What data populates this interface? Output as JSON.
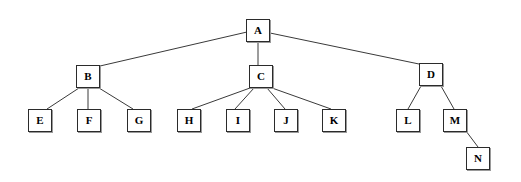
{
  "diagram": {
    "type": "tree-diagram",
    "canvas": {
      "width": 521,
      "height": 182,
      "background": "#ffffff"
    },
    "style": {
      "node_fill": "#ffffff",
      "node_border": "#2b2b2b",
      "node_shadow": "#9a9a9a",
      "edge_color": "#3a3a3a",
      "label_color": "#000000"
    },
    "nodes": [
      {
        "id": "A",
        "label": "A",
        "x": 246,
        "y": 19,
        "w": 24,
        "h": 23,
        "level": 0
      },
      {
        "id": "B",
        "label": "B",
        "x": 76,
        "y": 65,
        "w": 24,
        "h": 23,
        "level": 1
      },
      {
        "id": "C",
        "label": "C",
        "x": 249,
        "y": 65,
        "w": 24,
        "h": 23,
        "level": 1
      },
      {
        "id": "D",
        "label": "D",
        "x": 419,
        "y": 63,
        "w": 24,
        "h": 23,
        "level": 1
      },
      {
        "id": "E",
        "label": "E",
        "x": 28,
        "y": 109,
        "w": 24,
        "h": 23,
        "level": 2
      },
      {
        "id": "F",
        "label": "F",
        "x": 77,
        "y": 109,
        "w": 24,
        "h": 23,
        "level": 2
      },
      {
        "id": "G",
        "label": "G",
        "x": 127,
        "y": 109,
        "w": 24,
        "h": 23,
        "level": 2
      },
      {
        "id": "H",
        "label": "H",
        "x": 177,
        "y": 109,
        "w": 24,
        "h": 23,
        "level": 2
      },
      {
        "id": "I",
        "label": "I",
        "x": 226,
        "y": 109,
        "w": 24,
        "h": 23,
        "level": 2
      },
      {
        "id": "J",
        "label": "J",
        "x": 274,
        "y": 109,
        "w": 24,
        "h": 23,
        "level": 2
      },
      {
        "id": "K",
        "label": "K",
        "x": 322,
        "y": 109,
        "w": 24,
        "h": 23,
        "level": 2
      },
      {
        "id": "L",
        "label": "L",
        "x": 396,
        "y": 109,
        "w": 24,
        "h": 23,
        "level": 2
      },
      {
        "id": "M",
        "label": "M",
        "x": 443,
        "y": 109,
        "w": 24,
        "h": 23,
        "level": 2
      },
      {
        "id": "N",
        "label": "N",
        "x": 466,
        "y": 147,
        "w": 24,
        "h": 23,
        "level": 3
      }
    ],
    "edges": [
      {
        "from": "A",
        "to": "B",
        "x1": 247,
        "y1": 32,
        "x2": 100,
        "y2": 66
      },
      {
        "from": "A",
        "to": "C",
        "x1": 258,
        "y1": 42,
        "x2": 258,
        "y2": 65
      },
      {
        "from": "A",
        "to": "D",
        "x1": 270,
        "y1": 33,
        "x2": 419,
        "y2": 64
      },
      {
        "from": "B",
        "to": "E",
        "x1": 79,
        "y1": 88,
        "x2": 47,
        "y2": 109
      },
      {
        "from": "B",
        "to": "F",
        "x1": 88,
        "y1": 88,
        "x2": 88,
        "y2": 109
      },
      {
        "from": "B",
        "to": "G",
        "x1": 99,
        "y1": 88,
        "x2": 133,
        "y2": 109
      },
      {
        "from": "C",
        "to": "H",
        "x1": 250,
        "y1": 88,
        "x2": 192,
        "y2": 109
      },
      {
        "from": "C",
        "to": "I",
        "x1": 254,
        "y1": 88,
        "x2": 235,
        "y2": 109
      },
      {
        "from": "C",
        "to": "J",
        "x1": 267,
        "y1": 88,
        "x2": 285,
        "y2": 109
      },
      {
        "from": "C",
        "to": "K",
        "x1": 272,
        "y1": 88,
        "x2": 331,
        "y2": 109
      },
      {
        "from": "D",
        "to": "L",
        "x1": 421,
        "y1": 86,
        "x2": 408,
        "y2": 109
      },
      {
        "from": "D",
        "to": "M",
        "x1": 441,
        "y1": 86,
        "x2": 454,
        "y2": 109
      },
      {
        "from": "M",
        "to": "N",
        "x1": 466,
        "y1": 131,
        "x2": 478,
        "y2": 147
      }
    ]
  }
}
